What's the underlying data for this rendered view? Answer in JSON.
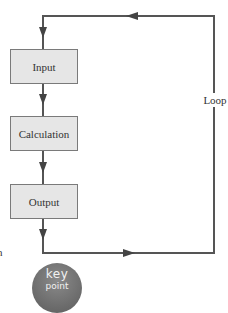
{
  "diagram": {
    "type": "flowchart-loop",
    "boxes": [
      {
        "id": "input",
        "label": "Input"
      },
      {
        "id": "calculation",
        "label": "Calculation"
      },
      {
        "id": "output",
        "label": "Output"
      }
    ],
    "loop_label": "Loop",
    "flow": [
      "Input",
      "Calculation",
      "Output",
      "Loop back to Input"
    ]
  },
  "margin_text": "n",
  "key_badge": {
    "word": "key",
    "sub": "point"
  },
  "colors": {
    "box_fill": "#e6e6e6",
    "box_border": "#7a7a7a",
    "line": "#555555",
    "badge": "#6e6e6e"
  }
}
